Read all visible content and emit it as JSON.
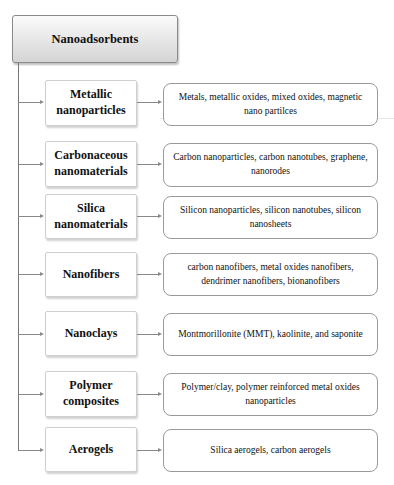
{
  "root": {
    "label": "Nanoadsorbents"
  },
  "colors": {
    "border": "#8a8a8a",
    "connector": "#888888",
    "root_gradient_top": "#fbfbfb",
    "root_gradient_bottom": "#d4d4d4"
  },
  "categories": [
    {
      "label": "Metallic nanoparticles",
      "description": "Metals, metallic oxides, mixed oxides, magnetic nano partilces"
    },
    {
      "label": "Carbonaceous nanomaterials",
      "description": "Carbon nanoparticles, carbon nanotubes, graphene, nanorodes"
    },
    {
      "label": "Silica nanomaterials",
      "description": "Silicon nanoparticles, silicon nanotubes, silicon nanosheets"
    },
    {
      "label": "Nanofibers",
      "description": "carbon nanofibers, metal oxides nanofibers, dendrimer nanofibers, bionanofibers"
    },
    {
      "label": "Nanoclays",
      "description": "Montmorillonite (MMT), kaolinite, and saponite"
    },
    {
      "label": "Polymer composites",
      "description": "Polymer/clay, polymer reinforced metal oxides nanoparticles"
    },
    {
      "label": "Aerogels",
      "description": "Silica aerogels, carbon aerogels"
    }
  ]
}
